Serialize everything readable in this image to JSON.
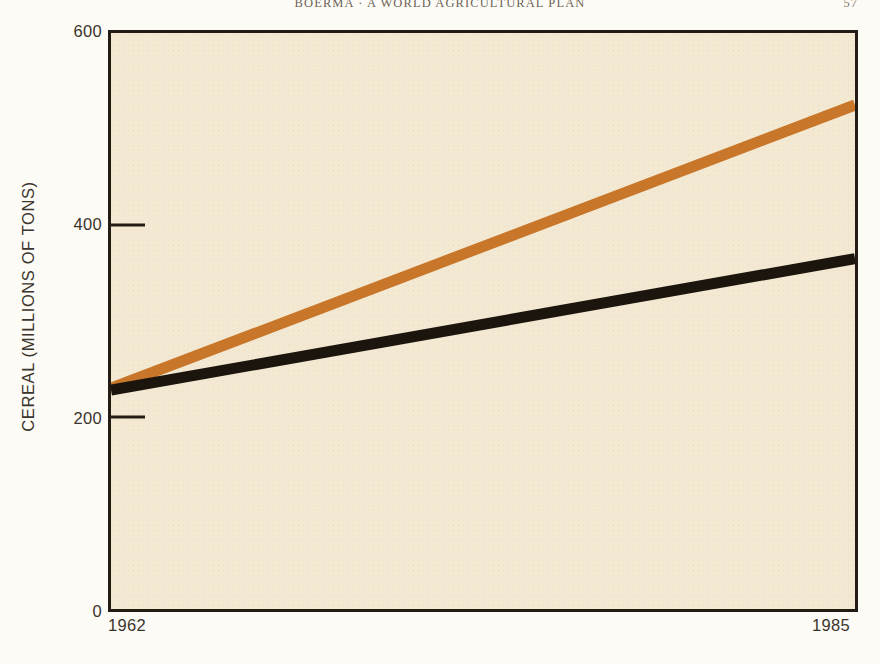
{
  "page": {
    "running_head": "BOERMA · A WORLD AGRICULTURAL PLAN",
    "folio": "57"
  },
  "chart_data": {
    "type": "line",
    "title": "",
    "subtitle": "",
    "xlabel": "",
    "ylabel": "CEREAL (MILLIONS OF TONS)",
    "xlim": [
      1962,
      1985
    ],
    "ylim": [
      0,
      600
    ],
    "grid": false,
    "legend": "none",
    "x_tick_labels": [
      "1962",
      "1985"
    ],
    "y_tick_labels": [
      "0",
      "200",
      "400",
      "600"
    ],
    "y_ticks": [
      0,
      200,
      400,
      600
    ],
    "x_ticks": [
      1962,
      1985
    ],
    "x": [
      1962,
      1985
    ],
    "series": [
      {
        "name": "Projected demand",
        "color": "#C8762A",
        "values": [
          230,
          525
        ]
      },
      {
        "name": "Projected production trend",
        "color": "#1C150E",
        "values": [
          228,
          365
        ]
      }
    ],
    "annotations": []
  },
  "colors": {
    "plot_background": "#F3E8D1",
    "page_background": "#FDFBF6",
    "frame": "#241C14",
    "orange_series": "#C8762A",
    "black_series": "#1C150E",
    "text": "#3A342C"
  }
}
